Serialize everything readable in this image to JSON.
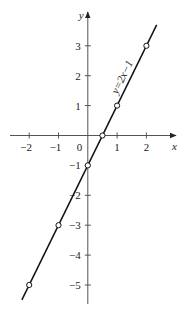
{
  "chart_data": {
    "type": "line",
    "title": "",
    "xlabel": "x",
    "ylabel": "y",
    "xlim": [
      -2.6,
      2.9
    ],
    "ylim": [
      -5.6,
      4.2
    ],
    "grid": false,
    "x_ticks": [
      -2,
      -1,
      1,
      2
    ],
    "x_tick_labels": [
      "−2",
      "−1",
      "1",
      "2"
    ],
    "y_ticks": [
      3,
      2,
      1,
      -1,
      -2,
      -3,
      -4,
      -5
    ],
    "y_tick_labels": [
      "3",
      "2",
      "1",
      "−1",
      "−2",
      "−3",
      "−4",
      "−5"
    ],
    "origin_label": "0",
    "series": [
      {
        "name": "y=2x−1",
        "equation": "y = 2x − 1",
        "line_x_range": [
          -2.25,
          2.35
        ],
        "points": [
          {
            "x": -2,
            "y": -5
          },
          {
            "x": -1,
            "y": -3
          },
          {
            "x": 0,
            "y": -1
          },
          {
            "x": 0.5,
            "y": 0
          },
          {
            "x": 1,
            "y": 1
          },
          {
            "x": 2,
            "y": 3
          }
        ]
      }
    ],
    "annotations": [
      {
        "text": "y=2x−1",
        "position": "along line near (1.2, 1.9)",
        "rotation": "parallel to line"
      }
    ]
  }
}
